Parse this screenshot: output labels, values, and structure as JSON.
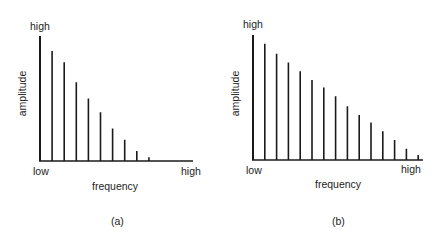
{
  "chart_data": [
    {
      "type": "bar",
      "title": "",
      "caption": "(a)",
      "xlabel": "frequency",
      "ylabel": "amplitude",
      "x_tick_labels": [
        "low",
        "high"
      ],
      "y_tick_labels": [
        "high"
      ],
      "grid": false,
      "legend": null,
      "description": "line spectrum with amplitude falling off rapidly with frequency",
      "categories": [
        1,
        2,
        3,
        4,
        5,
        6,
        7,
        8,
        9,
        10
      ],
      "values": [
        100,
        88,
        79,
        63,
        50,
        39,
        26,
        17,
        8,
        3
      ],
      "ylim": [
        0,
        100
      ]
    },
    {
      "type": "bar",
      "title": "",
      "caption": "(b)",
      "xlabel": "frequency",
      "ylabel": "amplitude",
      "x_tick_labels": [
        "low",
        "high"
      ],
      "y_tick_labels": [
        "high"
      ],
      "grid": false,
      "legend": null,
      "description": "line spectrum with amplitude falling off gradually (linearly) with frequency",
      "categories": [
        1,
        2,
        3,
        4,
        5,
        6,
        7,
        8,
        9,
        10,
        11,
        12,
        13,
        14,
        15
      ],
      "values": [
        100,
        93,
        85,
        78,
        71,
        64,
        58,
        51,
        43,
        36,
        30,
        23,
        16,
        9,
        4
      ],
      "ylim": [
        0,
        100
      ]
    }
  ],
  "panels": [
    {
      "y_high": "high",
      "y_axis_label": "amplitude",
      "x_low": "low",
      "x_high": "high",
      "x_axis_label": "frequency",
      "caption": "(a)"
    },
    {
      "y_high": "high",
      "y_axis_label": "amplitude",
      "x_low": "low",
      "x_high": "high",
      "x_axis_label": "frequency",
      "caption": "(b)"
    }
  ],
  "style": {
    "ink": "#1a1a1a"
  }
}
